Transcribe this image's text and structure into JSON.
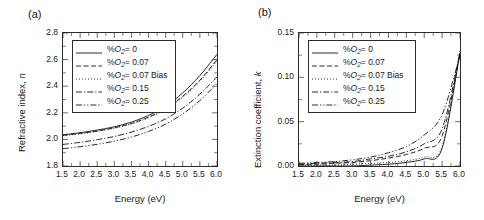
{
  "figure": {
    "panels": [
      {
        "label": "(a)",
        "ylabel_prefix": "Refractive index, ",
        "ylabel_symbol": "n",
        "xlabel": "Energy (eV)",
        "yticks": [
          "1.8",
          "2.0",
          "2.2",
          "2.4",
          "2.6",
          "2.8"
        ],
        "xticks": [
          "1.5",
          "2.0",
          "2.5",
          "3.0",
          "3.5",
          "4.0",
          "4.5",
          "5.0",
          "5.5",
          "6.0"
        ]
      },
      {
        "label": "(b)",
        "ylabel_prefix": "Extinction coefficient, ",
        "ylabel_symbol": "k",
        "xlabel": "Energy (eV)",
        "yticks": [
          "0.00",
          "0.05",
          "0.10",
          "0.15"
        ],
        "xticks": [
          "1.5",
          "2.0",
          "2.5",
          "3.0",
          "3.5",
          "4.0",
          "4.5",
          "5.0",
          "5.5",
          "6.0"
        ]
      }
    ],
    "legend": [
      {
        "prefix": "%",
        "symbol": "O",
        "sub": "2",
        "value": "= 0",
        "style": "solid"
      },
      {
        "prefix": "%",
        "symbol": "O",
        "sub": "2",
        "value": "= 0.07",
        "style": "dashed"
      },
      {
        "prefix": "%",
        "symbol": "O",
        "sub": "2",
        "value": "= 0.07 Bias",
        "style": "dotted"
      },
      {
        "prefix": "%",
        "symbol": "O",
        "sub": "2",
        "value": "= 0.15",
        "style": "dashdot"
      },
      {
        "prefix": "%",
        "symbol": "O",
        "sub": "2",
        "value": "= 0.25",
        "style": "dashdotdot"
      }
    ]
  },
  "chart_data": [
    {
      "type": "line",
      "title": "(a) Refractive index vs Energy",
      "xlabel": "Energy (eV)",
      "ylabel": "Refractive index, n",
      "xlim": [
        1.5,
        6.0
      ],
      "ylim": [
        1.8,
        2.8
      ],
      "xticks": [
        1.5,
        2.0,
        2.5,
        3.0,
        3.5,
        4.0,
        4.5,
        5.0,
        5.5,
        6.0
      ],
      "yticks": [
        1.8,
        2.0,
        2.2,
        2.4,
        2.6,
        2.8
      ],
      "grid": false,
      "legend_position": "upper left",
      "x": [
        1.5,
        2.0,
        2.5,
        3.0,
        3.5,
        4.0,
        4.5,
        5.0,
        5.5,
        6.0
      ],
      "series": [
        {
          "name": "%O2= 0",
          "style": "solid",
          "values": [
            2.035,
            2.05,
            2.07,
            2.095,
            2.13,
            2.18,
            2.25,
            2.35,
            2.48,
            2.64
          ]
        },
        {
          "name": "%O2= 0.07",
          "style": "dashed",
          "values": [
            2.03,
            2.045,
            2.063,
            2.088,
            2.12,
            2.168,
            2.232,
            2.325,
            2.445,
            2.6
          ]
        },
        {
          "name": "%O2= 0.07 Bias",
          "style": "dotted",
          "values": [
            2.028,
            2.042,
            2.06,
            2.084,
            2.116,
            2.163,
            2.226,
            2.318,
            2.437,
            2.59
          ]
        },
        {
          "name": "%O2= 0.15",
          "style": "dashdot",
          "values": [
            1.962,
            1.978,
            1.998,
            2.022,
            2.055,
            2.098,
            2.155,
            2.235,
            2.34,
            2.47
          ]
        },
        {
          "name": "%O2= 0.25",
          "style": "dashdotdot",
          "values": [
            1.93,
            1.945,
            1.963,
            1.987,
            2.018,
            2.06,
            2.115,
            2.192,
            2.292,
            2.42
          ]
        }
      ]
    },
    {
      "type": "line",
      "title": "(b) Extinction coefficient vs Energy",
      "xlabel": "Energy (eV)",
      "ylabel": "Extinction coefficient, k",
      "xlim": [
        1.5,
        6.0
      ],
      "ylim": [
        0.0,
        0.15
      ],
      "xticks": [
        1.5,
        2.0,
        2.5,
        3.0,
        3.5,
        4.0,
        4.5,
        5.0,
        5.5,
        6.0
      ],
      "yticks": [
        0.0,
        0.05,
        0.1,
        0.15
      ],
      "grid": false,
      "legend_position": "upper left",
      "x": [
        1.5,
        2.0,
        2.5,
        3.0,
        3.5,
        4.0,
        4.5,
        5.0,
        5.5,
        6.0
      ],
      "series": [
        {
          "name": "%O2= 0",
          "style": "solid",
          "values": [
            0.0,
            0.0,
            0.0,
            0.0,
            0.001,
            0.002,
            0.004,
            0.008,
            0.02,
            0.128
          ]
        },
        {
          "name": "%O2= 0.07",
          "style": "dashed",
          "values": [
            0.002,
            0.002,
            0.003,
            0.004,
            0.006,
            0.009,
            0.013,
            0.02,
            0.034,
            0.126
          ]
        },
        {
          "name": "%O2= 0.07 Bias",
          "style": "dotted",
          "values": [
            0.001,
            0.001,
            0.001,
            0.002,
            0.003,
            0.004,
            0.006,
            0.01,
            0.022,
            0.13
          ]
        },
        {
          "name": "%O2= 0.15",
          "style": "dashdot",
          "values": [
            0.002,
            0.003,
            0.004,
            0.005,
            0.008,
            0.011,
            0.016,
            0.025,
            0.042,
            0.127
          ]
        },
        {
          "name": "%O2= 0.25",
          "style": "dashdotdot",
          "values": [
            0.003,
            0.004,
            0.005,
            0.007,
            0.01,
            0.015,
            0.022,
            0.035,
            0.058,
            0.125
          ]
        }
      ]
    }
  ]
}
